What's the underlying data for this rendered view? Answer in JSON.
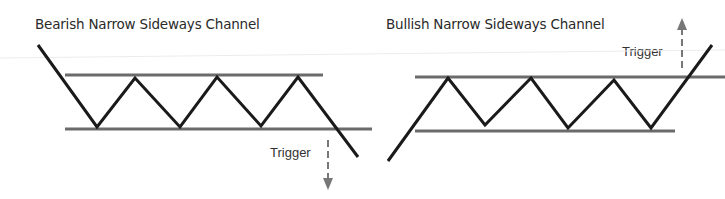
{
  "diagram": {
    "colors": {
      "price_line": "#1a1a1a",
      "channel_line": "#6b6b6b",
      "trigger_arrow": "#777777",
      "text": "#2a2a2a",
      "background": "#ffffff"
    },
    "panels": [
      {
        "id": "bearish",
        "title": "Bearish Narrow Sideways Channel",
        "trigger_label": "Trigger",
        "breakout_direction": "down",
        "price_path": [
          [
            38,
            45
          ],
          [
            97,
            127
          ],
          [
            135,
            78
          ],
          [
            180,
            127
          ],
          [
            217,
            77
          ],
          [
            261,
            126
          ],
          [
            298,
            77
          ],
          [
            358,
            157
          ]
        ],
        "upper_channel": [
          [
            65,
            75
          ],
          [
            323,
            75
          ]
        ],
        "lower_channel": [
          [
            65,
            129
          ],
          [
            372,
            129
          ]
        ],
        "arrow": {
          "x": 328,
          "y_start": 140,
          "y_end": 190
        }
      },
      {
        "id": "bullish",
        "title": "Bullish Narrow Sideways Channel",
        "trigger_label": "Trigger",
        "breakout_direction": "up",
        "price_path": [
          [
            388,
            161
          ],
          [
            448,
            78
          ],
          [
            485,
            125
          ],
          [
            531,
            78
          ],
          [
            568,
            128
          ],
          [
            614,
            80
          ],
          [
            651,
            128
          ],
          [
            712,
            45
          ]
        ],
        "upper_channel": [
          [
            415,
            77
          ],
          [
            725,
            77
          ]
        ],
        "lower_channel": [
          [
            415,
            131
          ],
          [
            675,
            131
          ]
        ],
        "arrow": {
          "x": 682,
          "y_start": 68,
          "y_end": 18
        }
      }
    ]
  }
}
